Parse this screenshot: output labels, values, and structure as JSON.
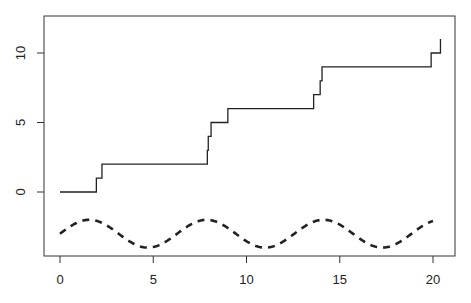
{
  "chart_data": {
    "type": "line",
    "title": "",
    "xlabel": "",
    "ylabel": "",
    "xlim": [
      -0.8,
      21
    ],
    "ylim": [
      -4.6,
      12.5
    ],
    "grid": false,
    "legend": null,
    "x_ticks": [
      0,
      5,
      10,
      15,
      20
    ],
    "x_tick_labels": [
      "0",
      "5",
      "10",
      "15",
      "20"
    ],
    "y_ticks": [
      0,
      5,
      10
    ],
    "y_tick_labels": [
      "0",
      "5",
      "10"
    ],
    "series": [
      {
        "name": "step counting process",
        "style": "solid step",
        "color": "#222222",
        "x": [
          0,
          1.95,
          2.25,
          7.9,
          7.95,
          8.1,
          9.0,
          13.6,
          13.95,
          14.05,
          19.9,
          20.4
        ],
        "y": [
          0,
          1,
          2,
          3,
          4,
          5,
          6,
          7,
          8,
          9,
          10,
          11
        ]
      },
      {
        "name": "sin(x) - 3",
        "style": "dashed",
        "color": "#222222",
        "function": "sin(x) - 3",
        "x_range": [
          0,
          20
        ]
      }
    ]
  },
  "axes": {
    "x_tick_labels": [
      "0",
      "5",
      "10",
      "15",
      "20"
    ],
    "y_tick_labels": [
      "0",
      "5",
      "10"
    ]
  }
}
